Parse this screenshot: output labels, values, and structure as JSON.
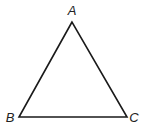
{
  "diagram": {
    "type": "triangle",
    "stroke_color": "#1a1a1a",
    "vertices": [
      {
        "label": "A",
        "x": 72,
        "y": 22,
        "label_x": 72,
        "label_y": 15
      },
      {
        "label": "B",
        "x": 19,
        "y": 117,
        "label_x": 10,
        "label_y": 122
      },
      {
        "label": "C",
        "x": 127,
        "y": 117,
        "label_x": 134,
        "label_y": 122
      }
    ]
  }
}
